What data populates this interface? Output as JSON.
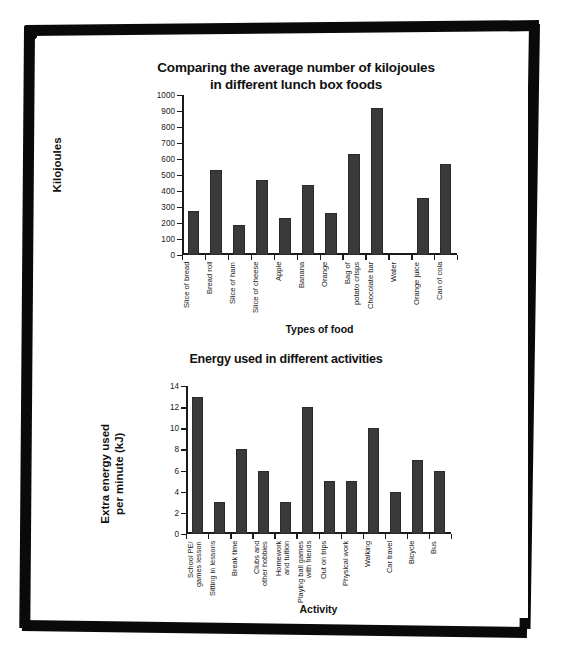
{
  "page": {
    "background_color": "#ffffff",
    "frame_color": "#0a0a0a",
    "bar_color": "#3a3a3a",
    "axis_color": "#1a1a1a"
  },
  "chart_data": [
    {
      "type": "bar",
      "id": "lunch-box-foods",
      "title": "Comparing the average number of kilojoules\nin different lunch box foods",
      "title_line1": "Comparing the average number of kilojoules",
      "title_line2": "in different lunch box foods",
      "xlabel": "Types of food",
      "ylabel": "Kilojoules",
      "ylim": [
        0,
        1000
      ],
      "ytick_step": 100,
      "yticks": [
        0,
        100,
        200,
        300,
        400,
        500,
        600,
        700,
        800,
        900,
        1000
      ],
      "grid": false,
      "legend": "none",
      "categories": [
        "Slice of bread",
        "Bread roll",
        "Slice of ham",
        "Slice of cheese",
        "Apple",
        "Banana",
        "Orange",
        "Bag of\npotato crisps",
        "Chocolate bar",
        "Water",
        "Orange juice",
        "Can of cola"
      ],
      "values": [
        275,
        530,
        190,
        470,
        230,
        440,
        260,
        630,
        920,
        0,
        355,
        570
      ]
    },
    {
      "type": "bar",
      "id": "energy-activities",
      "title": "Energy used in different activities",
      "xlabel": "Activity",
      "ylabel": "Extra energy used\nper minute (kJ)",
      "ylabel_line1": "Extra energy used",
      "ylabel_line2": "per minute (kJ)",
      "ylim": [
        0,
        14
      ],
      "ytick_step": 2,
      "yticks": [
        0,
        2,
        4,
        6,
        8,
        10,
        12,
        14
      ],
      "grid": false,
      "legend": "none",
      "categories": [
        "School PE/\ngames lesson",
        "Sitting in lessons",
        "Break time",
        "Clubs and\nother hobbies",
        "Homework\nand tuition",
        "Playing ball games\nwith friends",
        "Out on trips",
        "Physical work",
        "Walking",
        "Car travel",
        "Bicycle",
        "Bus"
      ],
      "values": [
        13,
        3,
        8,
        6,
        3,
        12,
        5,
        5,
        10,
        4,
        7,
        6
      ]
    }
  ]
}
